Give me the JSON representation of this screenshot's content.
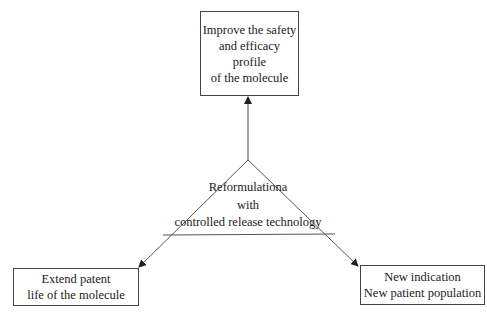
{
  "diagram": {
    "center": {
      "lines": [
        "Reformulationa",
        "with",
        "controlled release technology"
      ]
    },
    "top_box": {
      "lines": [
        "Improve the safety",
        "and efficacy profile",
        "of the molecule"
      ]
    },
    "left_box": {
      "lines": [
        "Extend patent",
        "life of the molecule"
      ]
    },
    "right_box": {
      "lines": [
        "New indication",
        "New patient population"
      ]
    }
  }
}
